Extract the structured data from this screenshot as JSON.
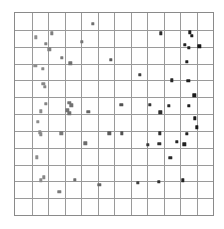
{
  "figure": {
    "title": "",
    "background_color": "#ffffff",
    "frame_color": "#8a8a8a",
    "grid_color": "#9a9a9a"
  },
  "chart_data": {
    "type": "scatter",
    "title": "",
    "xlabel": "",
    "ylabel": "",
    "xlim": [
      0,
      12
    ],
    "ylim": [
      0,
      12
    ],
    "grid": true,
    "grid_spacing_x": 1,
    "grid_spacing_y": 1,
    "xticks": [
      0,
      1,
      2,
      3,
      4,
      5,
      6,
      7,
      8,
      9,
      10,
      11,
      12
    ],
    "yticks": [
      0,
      1,
      2,
      3,
      4,
      5,
      6,
      7,
      8,
      9,
      10,
      11,
      12
    ],
    "xtick_labels": [],
    "ytick_labels": [],
    "legend": null,
    "marker": "square",
    "marker_size": 3.4,
    "color_note": "marker darkness increases with x: light gray at left, black at right",
    "color_low": "#9a9a9a",
    "color_high": "#161616",
    "points": [
      {
        "x": 4.7,
        "y": 11.35,
        "color": "#6f6f6f"
      },
      {
        "x": 1.27,
        "y": 10.55,
        "color": "#8e8e8e"
      },
      {
        "x": 2.23,
        "y": 10.8,
        "color": "#7e7e7e"
      },
      {
        "x": 8.83,
        "y": 10.8,
        "color": "#2d2d2d"
      },
      {
        "x": 10.6,
        "y": 10.85,
        "color": "#1d1d1d"
      },
      {
        "x": 10.72,
        "y": 10.66,
        "color": "#1c1c1c"
      },
      {
        "x": 4.05,
        "y": 10.3,
        "color": "#757575"
      },
      {
        "x": 1.86,
        "y": 10.16,
        "color": "#848484"
      },
      {
        "x": 10.3,
        "y": 10.1,
        "color": "#222222"
      },
      {
        "x": 11.18,
        "y": 10.02,
        "color": "#191919"
      },
      {
        "x": 2.08,
        "y": 9.85,
        "color": "#818181"
      },
      {
        "x": 10.55,
        "y": 9.95,
        "color": "#1e1e1e"
      },
      {
        "x": 2.83,
        "y": 9.35,
        "color": "#797979"
      },
      {
        "x": 5.8,
        "y": 9.22,
        "color": "#5b5b5b"
      },
      {
        "x": 3.36,
        "y": 9.02,
        "color": "#727272"
      },
      {
        "x": 10.42,
        "y": 9.1,
        "color": "#202020"
      },
      {
        "x": 1.24,
        "y": 8.85,
        "color": "#8e8e8e"
      },
      {
        "x": 1.7,
        "y": 8.7,
        "color": "#888888"
      },
      {
        "x": 7.58,
        "y": 8.32,
        "color": "#3f3f3f"
      },
      {
        "x": 9.5,
        "y": 8.0,
        "color": "#282828"
      },
      {
        "x": 10.5,
        "y": 7.98,
        "color": "#1f1f1f"
      },
      {
        "x": 1.72,
        "y": 7.8,
        "color": "#878787"
      },
      {
        "x": 1.8,
        "y": 7.6,
        "color": "#868686"
      },
      {
        "x": 10.86,
        "y": 7.12,
        "color": "#1b1b1b"
      },
      {
        "x": 1.85,
        "y": 6.62,
        "color": "#858585"
      },
      {
        "x": 3.3,
        "y": 6.65,
        "color": "#737373"
      },
      {
        "x": 3.42,
        "y": 6.52,
        "color": "#717171"
      },
      {
        "x": 6.45,
        "y": 6.55,
        "color": "#525252"
      },
      {
        "x": 8.18,
        "y": 6.55,
        "color": "#353535"
      },
      {
        "x": 9.32,
        "y": 6.48,
        "color": "#2a2a2a"
      },
      {
        "x": 10.52,
        "y": 6.5,
        "color": "#1e1e1e"
      },
      {
        "x": 1.56,
        "y": 6.15,
        "color": "#8a8a8a"
      },
      {
        "x": 3.18,
        "y": 6.22,
        "color": "#757575"
      },
      {
        "x": 3.3,
        "y": 6.05,
        "color": "#737373"
      },
      {
        "x": 4.45,
        "y": 6.12,
        "color": "#666666"
      },
      {
        "x": 8.8,
        "y": 6.1,
        "color": "#2e2e2e"
      },
      {
        "x": 10.9,
        "y": 5.75,
        "color": "#1a1a1a"
      },
      {
        "x": 1.4,
        "y": 5.55,
        "color": "#8c8c8c"
      },
      {
        "x": 11.02,
        "y": 5.2,
        "color": "#181818"
      },
      {
        "x": 1.52,
        "y": 4.92,
        "color": "#8b8b8b"
      },
      {
        "x": 1.58,
        "y": 4.8,
        "color": "#8a8a8a"
      },
      {
        "x": 2.8,
        "y": 4.85,
        "color": "#797979"
      },
      {
        "x": 5.72,
        "y": 4.85,
        "color": "#5c5c5c"
      },
      {
        "x": 6.48,
        "y": 4.85,
        "color": "#525252"
      },
      {
        "x": 8.78,
        "y": 4.85,
        "color": "#2e2e2e"
      },
      {
        "x": 10.42,
        "y": 4.82,
        "color": "#202020"
      },
      {
        "x": 4.25,
        "y": 4.25,
        "color": "#6c6c6c"
      },
      {
        "x": 8.05,
        "y": 4.18,
        "color": "#373737"
      },
      {
        "x": 8.75,
        "y": 4.22,
        "color": "#2f2f2f"
      },
      {
        "x": 9.8,
        "y": 4.35,
        "color": "#252525"
      },
      {
        "x": 10.25,
        "y": 4.2,
        "color": "#212121"
      },
      {
        "x": 1.32,
        "y": 3.42,
        "color": "#8d8d8d"
      },
      {
        "x": 9.42,
        "y": 3.4,
        "color": "#292929"
      },
      {
        "x": 1.75,
        "y": 2.25,
        "color": "#878787"
      },
      {
        "x": 1.58,
        "y": 2.05,
        "color": "#8a8a8a"
      },
      {
        "x": 3.62,
        "y": 2.08,
        "color": "#6f6f6f"
      },
      {
        "x": 5.12,
        "y": 1.8,
        "color": "#646464"
      },
      {
        "x": 7.45,
        "y": 1.92,
        "color": "#414141"
      },
      {
        "x": 8.72,
        "y": 1.98,
        "color": "#2f2f2f"
      },
      {
        "x": 10.18,
        "y": 2.05,
        "color": "#222222"
      },
      {
        "x": 2.68,
        "y": 1.38,
        "color": "#7a7a7a"
      }
    ]
  }
}
